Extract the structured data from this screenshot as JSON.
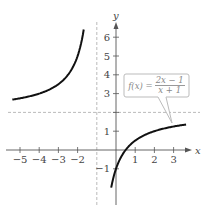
{
  "chart_data": {
    "type": "line",
    "title": "",
    "xlabel": "x",
    "ylabel": "y",
    "function": "f(x) = (2x - 1)/(x + 1)",
    "label": {
      "lhs": "f(x) =",
      "numerator": "2x − 1",
      "denominator": "x + 1"
    },
    "xlim": [
      -5.4,
      3.7
    ],
    "ylim": [
      -2.6,
      6.8
    ],
    "x_ticks": [
      -5,
      -4,
      -3,
      -2,
      1,
      2,
      3
    ],
    "y_ticks": [
      -1,
      1,
      2,
      3,
      4,
      5,
      6
    ],
    "x_tick_labels": [
      "−5",
      "−4",
      "−3",
      "−2",
      "1",
      "2",
      "3"
    ],
    "y_tick_labels": [
      "−1",
      "1",
      "",
      "3",
      "4",
      "5",
      "6"
    ],
    "asymptotes": {
      "vertical": -1,
      "horizontal": 2,
      "style": "dashed"
    },
    "series": [
      {
        "name": "left branch",
        "x": [
          -5.3,
          -5,
          -4,
          -3,
          -2.5,
          -2,
          -1.8,
          -1.68
        ],
        "y": [
          2.7,
          2.75,
          3.0,
          3.5,
          4.0,
          5.0,
          5.75,
          6.4
        ]
      },
      {
        "name": "right branch",
        "x": [
          -0.24,
          0,
          0.5,
          1,
          2,
          3,
          3.6
        ],
        "y": [
          -2.63,
          -1,
          0,
          0.5,
          1.0,
          1.25,
          1.35
        ]
      }
    ],
    "grid": false,
    "legend": "callout box pointing to right branch"
  },
  "axes": {
    "x_label": "x",
    "y_label": "y"
  }
}
